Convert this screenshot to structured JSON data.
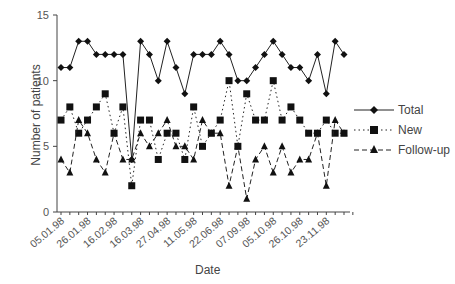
{
  "chart_data": {
    "type": "line",
    "title": "",
    "xlabel": "Date",
    "ylabel": "Number of patients",
    "ylim": [
      0,
      15
    ],
    "yticks": [
      0,
      5,
      10,
      15
    ],
    "grid": false,
    "legend_position": "right",
    "x_tick_labels": [
      "05.01.98",
      "26.01.98",
      "16.02.98",
      "16.03.98",
      "27.04.98",
      "11.05.98",
      "22.06.98",
      "07.09.98",
      "05.10.98",
      "26.10.98",
      "23.11.98"
    ],
    "n_points": 33,
    "series": [
      {
        "name": "Total",
        "style": "solid",
        "marker": "diamond",
        "values": [
          11,
          11,
          13,
          13,
          12,
          12,
          12,
          12,
          4,
          13,
          12,
          10,
          13,
          11,
          9,
          12,
          12,
          12,
          13,
          12,
          10,
          10,
          11,
          12,
          13,
          12,
          11,
          11,
          10,
          12,
          9,
          13,
          12
        ]
      },
      {
        "name": "New",
        "style": "dotted",
        "marker": "square",
        "values": [
          7,
          8,
          6,
          7,
          8,
          9,
          6,
          8,
          2,
          7,
          7,
          4,
          6,
          6,
          4,
          8,
          5,
          6,
          7,
          10,
          5,
          9,
          7,
          7,
          10,
          7,
          8,
          7,
          6,
          6,
          7,
          6,
          6
        ]
      },
      {
        "name": "Follow-up",
        "style": "dashed",
        "marker": "triangle",
        "values": [
          4,
          3,
          7,
          6,
          4,
          3,
          6,
          4,
          4,
          6,
          5,
          6,
          7,
          5,
          5,
          4,
          7,
          6,
          6,
          2,
          5,
          1,
          4,
          5,
          3,
          5,
          3,
          4,
          4,
          6,
          2,
          7,
          6
        ]
      }
    ]
  },
  "legend": {
    "items": [
      "Total",
      "New",
      "Follow-up"
    ]
  },
  "axes": {
    "xlabel": "Date",
    "ylabel": "Number of patients"
  }
}
